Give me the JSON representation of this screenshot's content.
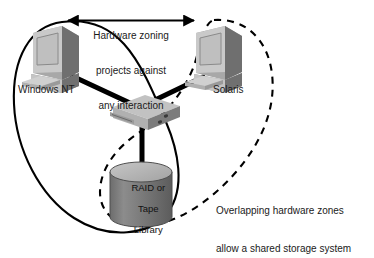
{
  "diagram": {
    "title_caption": {
      "line1": "Hardware zoning",
      "line2": "projects against",
      "line3": "any interaction"
    },
    "bottom_caption": {
      "line1": "Overlapping hardware zones",
      "line2": "allow a shared storage system"
    },
    "nodes": {
      "host_left": {
        "label": "Windows NT",
        "icon": "desktop-computer-icon"
      },
      "host_right": {
        "label": "Solaris",
        "icon": "desktop-computer-icon"
      },
      "switch": {
        "label": "",
        "icon": "network-switch-icon"
      },
      "storage": {
        "label_line1": "RAID or",
        "label_line2": "Tape",
        "label_line3": "Library",
        "icon": "storage-cylinder-icon"
      }
    },
    "zones": {
      "solid_zone": {
        "name": "hardware-zone-solid",
        "style": "solid",
        "members": "Windows NT + RAID or Tape Library"
      },
      "dashed_zone": {
        "name": "hardware-zone-dashed",
        "style": "dashed",
        "members": "Solaris + RAID or Tape Library"
      }
    },
    "connector_arrow": {
      "name": "no-interaction-arrow",
      "direction": "bidirectional"
    },
    "colors": {
      "background": "#ffffff",
      "line": "#000000",
      "text": "#1a1a1a",
      "device_light": "#cfcfcf",
      "device_mid": "#9a9a9a",
      "device_dark": "#6e6e6e",
      "screen": "#bdbdbd",
      "storage_body": "#7d7d7d",
      "storage_top": "#b8b8b8"
    }
  }
}
